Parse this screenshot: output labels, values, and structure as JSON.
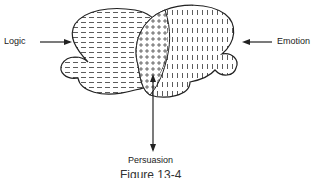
{
  "diagram": {
    "labels": {
      "logic": "Logic",
      "emotion": "Emotion",
      "persuasion": "Persuasion"
    },
    "caption": "Figure 13-4",
    "colors": {
      "stroke": "#222222",
      "background": "#ffffff"
    }
  }
}
